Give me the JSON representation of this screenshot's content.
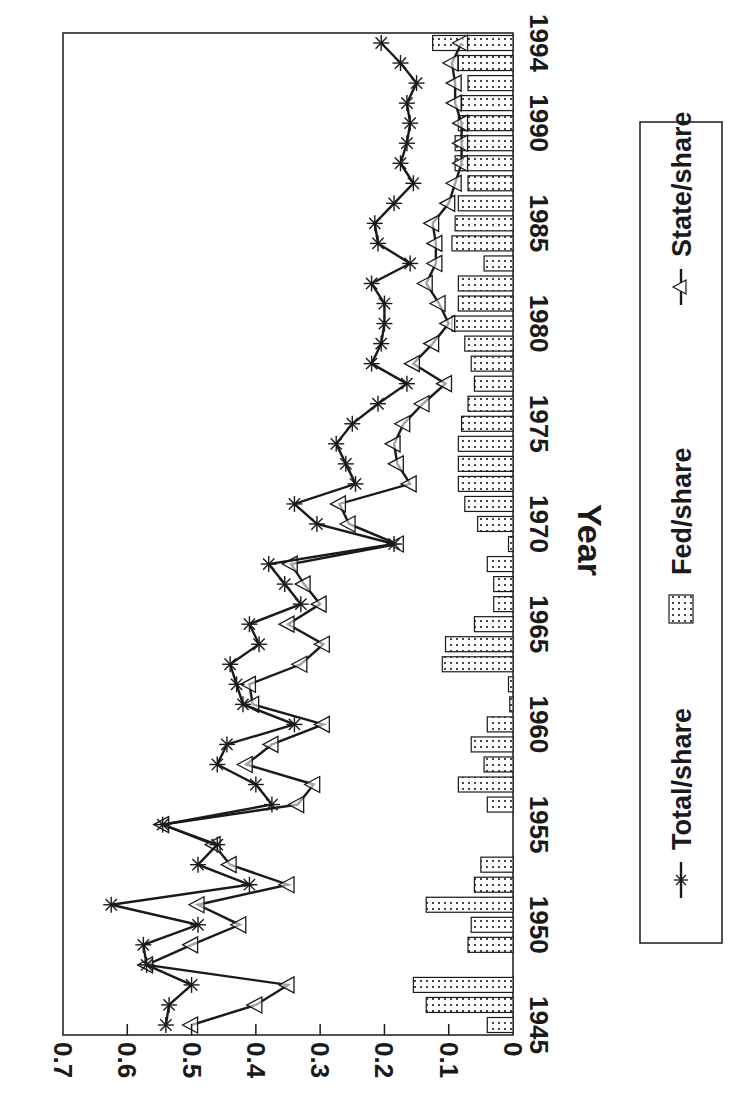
{
  "chart_data": {
    "type": "bar+line",
    "title": "",
    "xlabel": "Year",
    "ylabel": "",
    "orientation_note": "figure rendered rotated 90 degrees clockwise",
    "ylim": [
      0,
      0.7
    ],
    "yticks": [
      "0",
      "0.1",
      "0.2",
      "0.3",
      "0.4",
      "0.5",
      "0.6",
      "0.7"
    ],
    "xticks": [
      "1945",
      "1950",
      "1955",
      "1960",
      "1965",
      "1970",
      "1975",
      "1980",
      "1985",
      "1990",
      "1994"
    ],
    "grid": false,
    "legend_position": "bottom",
    "x": [
      1945,
      1946,
      1947,
      1948,
      1949,
      1950,
      1951,
      1952,
      1953,
      1954,
      1955,
      1956,
      1957,
      1958,
      1959,
      1960,
      1961,
      1962,
      1963,
      1964,
      1965,
      1966,
      1967,
      1968,
      1969,
      1970,
      1971,
      1972,
      1973,
      1974,
      1975,
      1976,
      1977,
      1978,
      1979,
      1980,
      1981,
      1982,
      1983,
      1984,
      1985,
      1986,
      1987,
      1988,
      1989,
      1990,
      1991,
      1992,
      1993,
      1994
    ],
    "series": [
      {
        "name": "Total/share",
        "type": "line",
        "marker": "asterisk",
        "values": [
          0.54,
          0.535,
          0.5,
          0.57,
          0.575,
          0.49,
          0.625,
          0.41,
          0.49,
          0.46,
          0.545,
          0.375,
          0.4,
          0.46,
          0.445,
          0.34,
          0.42,
          0.43,
          0.44,
          0.395,
          0.41,
          0.33,
          0.355,
          0.38,
          0.185,
          0.305,
          0.34,
          0.245,
          0.26,
          0.275,
          0.25,
          0.21,
          0.165,
          0.22,
          0.205,
          0.2,
          0.2,
          0.22,
          0.16,
          0.21,
          0.215,
          0.185,
          0.155,
          0.175,
          0.165,
          0.16,
          0.165,
          0.15,
          0.175,
          0.205
        ]
      },
      {
        "name": "Fed/share",
        "type": "bar",
        "pattern": "dotted",
        "values": [
          0.04,
          0.135,
          0.155,
          0.0,
          0.07,
          0.065,
          0.135,
          0.06,
          0.05,
          0.0,
          0.0,
          0.04,
          0.085,
          0.045,
          0.065,
          0.04,
          0.005,
          0.007,
          0.11,
          0.105,
          0.06,
          0.03,
          0.03,
          0.04,
          0.007,
          0.055,
          0.075,
          0.085,
          0.085,
          0.085,
          0.08,
          0.07,
          0.06,
          0.065,
          0.075,
          0.095,
          0.085,
          0.085,
          0.045,
          0.095,
          0.09,
          0.085,
          0.07,
          0.09,
          0.09,
          0.085,
          0.08,
          0.07,
          0.085,
          0.125
        ]
      },
      {
        "name": "State/share",
        "type": "line",
        "marker": "triangle",
        "values": [
          0.5,
          0.4,
          0.35,
          0.57,
          0.5,
          0.425,
          0.49,
          0.35,
          0.44,
          0.465,
          0.545,
          0.335,
          0.31,
          0.415,
          0.375,
          0.295,
          0.405,
          0.41,
          0.33,
          0.295,
          0.35,
          0.3,
          0.325,
          0.345,
          0.18,
          0.255,
          0.27,
          0.16,
          0.18,
          0.185,
          0.17,
          0.14,
          0.105,
          0.155,
          0.125,
          0.1,
          0.115,
          0.135,
          0.12,
          0.12,
          0.125,
          0.1,
          0.09,
          0.08,
          0.08,
          0.08,
          0.09,
          0.09,
          0.095,
          0.08
        ]
      }
    ]
  },
  "legend": {
    "items": [
      {
        "label": "Total/share",
        "symbol": "asterisk-line-icon"
      },
      {
        "label": "Fed/share",
        "symbol": "dotted-box-icon"
      },
      {
        "label": "State/share",
        "symbol": "triangle-line-icon"
      }
    ]
  },
  "colors": {
    "ink": "#1a1a1a",
    "background": "#ffffff"
  }
}
